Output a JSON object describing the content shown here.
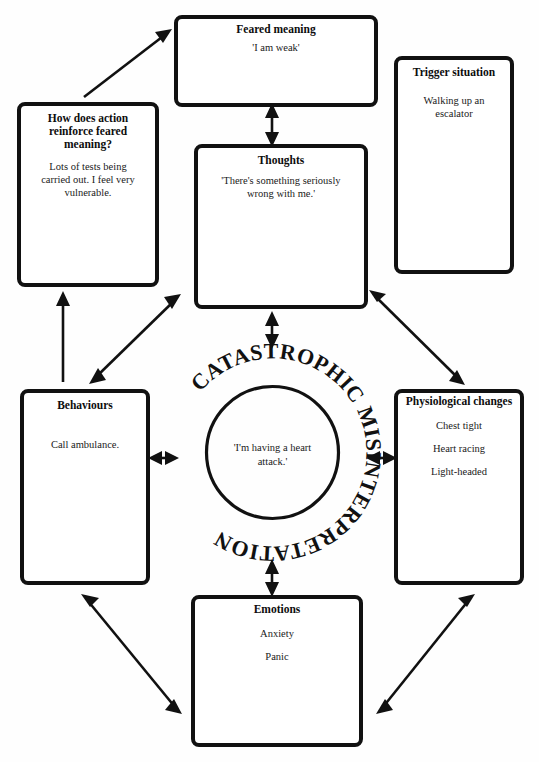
{
  "diagram": {
    "center": {
      "ring_label": "CATASTROPHIC MISINTERPRETATION",
      "inner_text_lines": [
        "'I'm having a heart",
        "attack.'"
      ]
    },
    "boxes": [
      {
        "id": "feared-meaning",
        "title": "Feared meaning",
        "lines": [
          "'I am weak'"
        ]
      },
      {
        "id": "trigger-situation",
        "title": "Trigger situation",
        "lines": [
          "Walking up an",
          "escalator"
        ]
      },
      {
        "id": "reinforce-feared-meaning",
        "title_lines": [
          "How does action",
          "reinforce feared",
          "meaning?"
        ],
        "lines": [
          "Lots of tests being",
          "carried out. I feel very",
          "vulnerable."
        ]
      },
      {
        "id": "thoughts",
        "title": "Thoughts",
        "lines": [
          "'There's something seriously",
          "wrong with me.'"
        ]
      },
      {
        "id": "behaviours",
        "title": "Behaviours",
        "lines": [
          "Call ambulance."
        ]
      },
      {
        "id": "physiological-changes",
        "title": "Physiological changes",
        "lines": [
          "Chest tight",
          "Heart racing",
          "Light-headed"
        ]
      },
      {
        "id": "emotions",
        "title": "Emotions",
        "lines": [
          "Anxiety",
          "Panic"
        ]
      }
    ],
    "colors": {
      "ink": "#111111",
      "paper": "#ffffff"
    }
  }
}
